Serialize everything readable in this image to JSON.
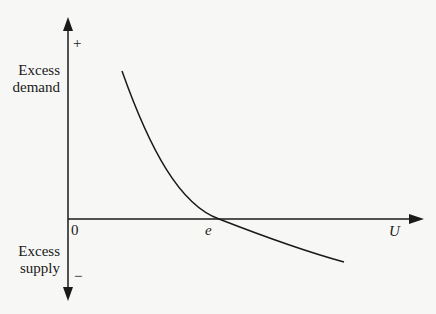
{
  "diagram": {
    "type": "economic curve diagram",
    "y_axis": {
      "positive_sign": "+",
      "negative_sign": "−",
      "upper_label_line1": "Excess",
      "upper_label_line2": "demand",
      "lower_label_line1": "Excess",
      "lower_label_line2": "supply"
    },
    "x_axis": {
      "label": "U",
      "origin_label": "0",
      "intersection_label": "e"
    },
    "curve": {
      "description": "Downward-sloping convex curve crossing the horizontal axis at e",
      "color": "#1a1a1a"
    }
  }
}
